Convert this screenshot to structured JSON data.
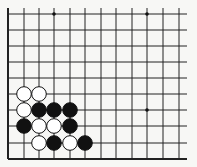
{
  "board": {
    "columns_x": [
      8,
      24,
      39,
      54,
      70,
      85,
      101,
      116,
      132,
      147,
      163,
      179
    ],
    "rows_y": [
      14,
      30,
      46,
      62,
      78,
      94,
      110,
      126,
      143,
      159
    ],
    "line_right_end": 187,
    "line_color": "#222222",
    "background": "#f7f7f5",
    "star_points": [
      [
        3,
        0
      ],
      [
        9,
        0
      ],
      [
        9,
        6
      ]
    ],
    "stone_radius": 7.3
  },
  "stones": [
    {
      "color": "white",
      "col": 1,
      "row": 5
    },
    {
      "color": "white",
      "col": 2,
      "row": 5
    },
    {
      "color": "white",
      "col": 1,
      "row": 6
    },
    {
      "color": "black",
      "col": 2,
      "row": 6
    },
    {
      "color": "black",
      "col": 3,
      "row": 6
    },
    {
      "color": "black",
      "col": 4,
      "row": 6
    },
    {
      "color": "black",
      "col": 1,
      "row": 7
    },
    {
      "color": "white",
      "col": 2,
      "row": 7
    },
    {
      "color": "white",
      "col": 3,
      "row": 7
    },
    {
      "color": "black",
      "col": 4,
      "row": 7
    },
    {
      "color": "white",
      "col": 2,
      "row": 8
    },
    {
      "color": "black",
      "col": 3,
      "row": 8
    },
    {
      "color": "white",
      "col": 4,
      "row": 8
    },
    {
      "color": "black",
      "col": 5,
      "row": 8
    }
  ]
}
